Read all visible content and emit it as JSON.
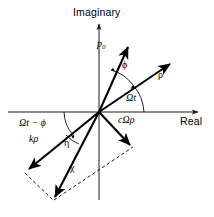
{
  "figure": {
    "background_color": "#ffffff",
    "stroke_color": "#000000",
    "width": 214,
    "height": 217
  },
  "axes": {
    "imaginary_label": "Imaginary",
    "real_label": "Real",
    "origin": {
      "x": 99,
      "y": 112
    },
    "imaginary_axis": {
      "x1": 99,
      "y1": 200,
      "x2": 99,
      "y2": 20
    },
    "real_axis": {
      "x1": 8,
      "y1": 112,
      "x2": 203,
      "y2": 112
    }
  },
  "vectors": [
    {
      "name": "p0",
      "label": "p",
      "subscript": "0",
      "label_x": 99,
      "label_y": 40,
      "tip": {
        "x": 130,
        "y": 45
      },
      "style": "solid-thick",
      "angle_deg": 65
    },
    {
      "name": "rho",
      "label": "ρ",
      "subscript": "",
      "label_x": 159,
      "label_y": 73,
      "tip": {
        "x": 172,
        "y": 62
      },
      "style": "solid-thick",
      "angle_deg": 40
    },
    {
      "name": "c-omega-rho",
      "label": "cΩρ",
      "subscript": "",
      "label_x": 119,
      "label_y": 117,
      "tip": {
        "x": 131,
        "y": 147
      },
      "style": "solid-thick",
      "angle_deg": -50
    },
    {
      "name": "k-rho",
      "label": "kρ",
      "subscript": "",
      "label_x": 31,
      "label_y": 136,
      "tip": {
        "x": 26,
        "y": 171
      },
      "style": "solid-thick",
      "angle_deg": -152
    },
    {
      "name": "chi-resultant",
      "label": "χ",
      "subscript": "",
      "label_x": 71,
      "label_y": 166,
      "tip": {
        "x": 52,
        "y": 199
      },
      "style": "solid-thick",
      "angle_deg": -120
    }
  ],
  "angles": [
    {
      "name": "phi",
      "label": "ϕ",
      "label_x": 123,
      "label_y": 63
    },
    {
      "name": "omega-t",
      "label": "Ωt",
      "label_x": 127,
      "label_y": 95
    },
    {
      "name": "omega-t-minus-phi",
      "label": "Ωt − ϕ",
      "label_x": 21,
      "label_y": 119
    },
    {
      "name": "eta",
      "label": "η",
      "label_x": 65,
      "label_y": 141
    }
  ],
  "dashed_edges": [
    {
      "name": "kp-to-chi",
      "x1": 26,
      "y1": 171,
      "x2": 52,
      "y2": 199
    },
    {
      "name": "chi-to-comegarho",
      "x1": 52,
      "y1": 199,
      "x2": 131,
      "y2": 147
    }
  ]
}
